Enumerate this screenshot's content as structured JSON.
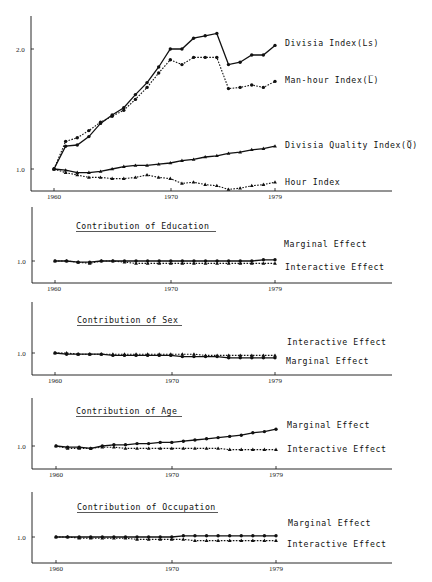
{
  "chart_data": [
    {
      "type": "line",
      "title": "",
      "xlabel": "",
      "ylabel": "",
      "x": [
        1960,
        1961,
        1962,
        1963,
        1964,
        1965,
        1966,
        1967,
        1968,
        1969,
        1970,
        1971,
        1972,
        1973,
        1974,
        1975,
        1976,
        1977,
        1978,
        1979
      ],
      "x_ticks": [
        "1960",
        "1970",
        "1979"
      ],
      "y_ticks": [
        "1.0",
        "2.0"
      ],
      "ylim": [
        0.82,
        2.27
      ],
      "grid": false,
      "legend_position": "right-inline",
      "series": [
        {
          "name": "Divisia Index(Ls)",
          "style": "solid",
          "marker": "circle",
          "values": [
            1.0,
            1.19,
            1.2,
            1.27,
            1.38,
            1.45,
            1.51,
            1.62,
            1.72,
            1.85,
            2.0,
            2.0,
            2.09,
            2.11,
            2.13,
            1.87,
            1.89,
            1.95,
            1.95,
            2.03
          ]
        },
        {
          "name": "Man-hour Index(L̅)",
          "style": "dotted",
          "marker": "circle",
          "values": [
            1.0,
            1.23,
            1.26,
            1.32,
            1.39,
            1.44,
            1.49,
            1.58,
            1.68,
            1.8,
            1.91,
            1.87,
            1.93,
            1.93,
            1.93,
            1.67,
            1.68,
            1.7,
            1.68,
            1.73
          ]
        },
        {
          "name": "Divisia Quality Index(Q̅)",
          "style": "solid",
          "marker": "triangle",
          "values": [
            1.0,
            0.99,
            0.97,
            0.97,
            0.98,
            1.0,
            1.02,
            1.03,
            1.03,
            1.04,
            1.05,
            1.07,
            1.08,
            1.1,
            1.11,
            1.13,
            1.14,
            1.16,
            1.17,
            1.19
          ]
        },
        {
          "name": "Hour Index",
          "style": "dotted",
          "marker": "triangle",
          "values": [
            1.0,
            0.97,
            0.95,
            0.93,
            0.93,
            0.92,
            0.92,
            0.93,
            0.95,
            0.93,
            0.92,
            0.88,
            0.89,
            0.87,
            0.86,
            0.83,
            0.84,
            0.86,
            0.87,
            0.89
          ]
        }
      ]
    },
    {
      "type": "line",
      "title": "Contribution of Education",
      "x": [
        1960,
        1961,
        1962,
        1963,
        1964,
        1965,
        1966,
        1967,
        1968,
        1969,
        1970,
        1971,
        1972,
        1973,
        1974,
        1975,
        1976,
        1977,
        1978,
        1979
      ],
      "x_ticks": [
        "1960",
        "1970",
        "1979"
      ],
      "y_ticks": [
        "1.0"
      ],
      "ylim": [
        0.8,
        1.2
      ],
      "series": [
        {
          "name": "Marginal Effect",
          "style": "solid",
          "marker": "circle",
          "values": [
            1.0,
            1.0,
            0.99,
            0.99,
            1.0,
            1.0,
            1.0,
            1.0,
            1.0,
            1.0,
            1.0,
            1.0,
            1.0,
            1.0,
            1.0,
            1.0,
            1.0,
            1.0,
            1.01,
            1.01
          ]
        },
        {
          "name": "Interactive Effect",
          "style": "dotted",
          "marker": "triangle",
          "values": [
            1.0,
            1.0,
            0.99,
            0.98,
            1.0,
            1.0,
            0.99,
            0.98,
            0.98,
            0.98,
            0.98,
            0.98,
            0.98,
            0.98,
            0.98,
            0.98,
            0.98,
            0.98,
            0.98,
            0.98
          ]
        }
      ]
    },
    {
      "type": "line",
      "title": "Contribution of Sex",
      "x": [
        1960,
        1961,
        1962,
        1963,
        1964,
        1965,
        1966,
        1967,
        1968,
        1969,
        1970,
        1971,
        1972,
        1973,
        1974,
        1975,
        1976,
        1977,
        1978,
        1979
      ],
      "x_ticks": [
        "1960",
        "1970",
        "1979"
      ],
      "y_ticks": [
        "1.0"
      ],
      "ylim": [
        0.8,
        1.2
      ],
      "series": [
        {
          "name": "Interactive Effect",
          "style": "dotted",
          "marker": "triangle",
          "values": [
            1.0,
            1.0,
            0.99,
            0.99,
            0.99,
            0.99,
            0.99,
            0.99,
            0.99,
            0.99,
            0.99,
            0.99,
            0.99,
            0.98,
            0.98,
            0.98,
            0.98,
            0.98,
            0.98,
            0.98
          ]
        },
        {
          "name": "Marginal Effect",
          "style": "solid",
          "marker": "circle",
          "values": [
            1.0,
            0.99,
            0.99,
            0.99,
            0.99,
            0.98,
            0.98,
            0.98,
            0.98,
            0.98,
            0.98,
            0.97,
            0.97,
            0.97,
            0.97,
            0.96,
            0.96,
            0.96,
            0.96,
            0.96
          ]
        }
      ]
    },
    {
      "type": "line",
      "title": "Contribution of Age",
      "x": [
        1960,
        1961,
        1962,
        1963,
        1964,
        1965,
        1966,
        1967,
        1968,
        1969,
        1970,
        1971,
        1972,
        1973,
        1974,
        1975,
        1976,
        1977,
        1978,
        1979
      ],
      "x_ticks": [
        "1960",
        "1970",
        "1979"
      ],
      "y_ticks": [
        "1.0"
      ],
      "ylim": [
        0.8,
        1.2
      ],
      "series": [
        {
          "name": "Marginal Effect",
          "style": "solid",
          "marker": "circle",
          "values": [
            1.0,
            0.99,
            0.99,
            0.98,
            1.0,
            1.01,
            1.01,
            1.02,
            1.02,
            1.03,
            1.03,
            1.04,
            1.05,
            1.06,
            1.07,
            1.08,
            1.09,
            1.11,
            1.12,
            1.14
          ]
        },
        {
          "name": "Interactive Effect",
          "style": "dotted",
          "marker": "triangle",
          "values": [
            1.0,
            0.98,
            0.98,
            0.98,
            0.99,
            0.99,
            0.98,
            0.98,
            0.98,
            0.98,
            0.98,
            0.98,
            0.98,
            0.98,
            0.98,
            0.97,
            0.97,
            0.97,
            0.97,
            0.97
          ]
        }
      ]
    },
    {
      "type": "line",
      "title": "Contribution of Occupation",
      "x": [
        1960,
        1961,
        1962,
        1963,
        1964,
        1965,
        1966,
        1967,
        1968,
        1969,
        1970,
        1971,
        1972,
        1973,
        1974,
        1975,
        1976,
        1977,
        1978,
        1979
      ],
      "x_ticks": [
        "1960",
        "1970",
        "1979"
      ],
      "y_ticks": [
        "1.0"
      ],
      "ylim": [
        0.8,
        1.2
      ],
      "series": [
        {
          "name": "Marginal Effect",
          "style": "solid",
          "marker": "circle",
          "values": [
            1.0,
            1.0,
            1.0,
            1.0,
            1.0,
            1.0,
            1.0,
            1.0,
            1.0,
            1.0,
            1.0,
            1.01,
            1.01,
            1.01,
            1.01,
            1.01,
            1.01,
            1.01,
            1.01,
            1.01
          ]
        },
        {
          "name": "Interactive Effect",
          "style": "dotted",
          "marker": "triangle",
          "values": [
            1.0,
            1.0,
            0.99,
            0.99,
            0.99,
            0.99,
            0.99,
            0.98,
            0.98,
            0.98,
            0.98,
            0.98,
            0.97,
            0.97,
            0.97,
            0.97,
            0.97,
            0.97,
            0.97,
            0.97
          ]
        }
      ]
    }
  ],
  "panels": [
    {
      "title": "",
      "tick_y": [
        "2.0",
        "1.0"
      ],
      "tick_x": [
        "1960",
        "1970",
        "1979"
      ],
      "labels": [
        "Divisia Index(Ls)",
        "Man-hour Index(L̅)",
        "Divisia Quality Index(Q̅)",
        "Hour Index"
      ]
    },
    {
      "title": "Contribution of Education",
      "tick_y": [
        "1.0"
      ],
      "tick_x": [
        "1960",
        "1970",
        "1979"
      ],
      "labels": [
        "Marginal Effect",
        "Interactive Effect"
      ]
    },
    {
      "title": "Contribution of Sex",
      "tick_y": [
        "1.0"
      ],
      "tick_x": [
        "1960",
        "1970",
        "1979"
      ],
      "labels": [
        "Interactive Effect",
        "Marginal Effect"
      ]
    },
    {
      "title": "Contribution of Age",
      "tick_y": [
        "1.0"
      ],
      "tick_x": [
        "1960",
        "1970",
        "1979"
      ],
      "labels": [
        "Marginal Effect",
        "Interactive Effect"
      ]
    },
    {
      "title": "Contribution of Occupation",
      "tick_y": [
        "1.0"
      ],
      "tick_x": [
        "1960",
        "1970",
        "1979"
      ],
      "labels": [
        "Marginal Effect",
        "Interactive Effect"
      ]
    }
  ]
}
